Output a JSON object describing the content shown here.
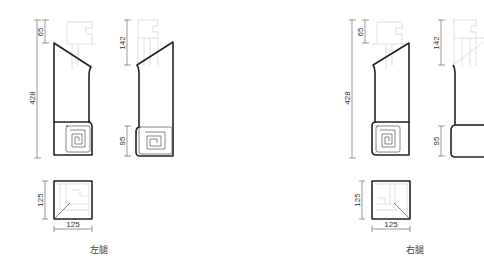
{
  "drawing": {
    "title": "Chair leg profile drawings",
    "left_leg": {
      "caption": "左腿",
      "side_view": {
        "total_height": "428",
        "top_offset": "65"
      },
      "front_view": {
        "top_offset": "142",
        "bottom_height": "95"
      },
      "section": {
        "width": "125",
        "height": "125"
      }
    },
    "right_leg": {
      "caption": "右腿",
      "side_view": {
        "total_height": "428",
        "top_offset": "65"
      },
      "front_view": {
        "top_offset": "142",
        "bottom_height": "95"
      },
      "section": {
        "width": "125",
        "height": "125"
      }
    },
    "colors": {
      "outline": "#222222",
      "ghost": "#c9c9c9",
      "dimension": "#555555"
    }
  }
}
